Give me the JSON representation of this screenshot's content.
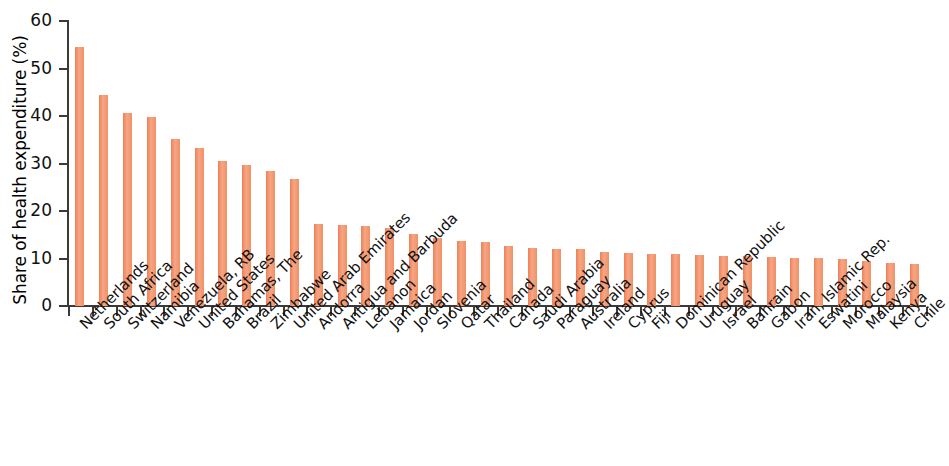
{
  "chart_data": {
    "type": "bar",
    "title": "",
    "subtitle": "",
    "xlabel": "",
    "ylabel": "Share of health expenditure (%)",
    "ylim": [
      0,
      60
    ],
    "yticks": [
      0,
      10,
      20,
      30,
      40,
      50,
      60
    ],
    "ytick_labels": [
      "0",
      "10",
      "20",
      "30",
      "40",
      "50",
      "60"
    ],
    "grid": false,
    "legend": null,
    "bar_color": "#f0885e",
    "axis_color": "#3a3a3a",
    "categories": [
      "Netherlands",
      "South Africa",
      "Switzerland",
      "Namibia",
      "Venezuela, RB",
      "United States",
      "Bahamas, The",
      "Brazil",
      "Zimbabwe",
      "United Arab Emirates",
      "Andorra",
      "Antigua and Barbuda",
      "Lebanon",
      "Jamaica",
      "Jordan",
      "Slovenia",
      "Qatar",
      "Thailand",
      "Canada",
      "Saudi Arabia",
      "Paraguay",
      "Australia",
      "Ireland",
      "Cyprus",
      "Fiji",
      "Dominican Republic",
      "Uruguay",
      "Israel",
      "Bahrain",
      "Gabon",
      "Iran, Islamic Rep.",
      "Eswatini",
      "Morocco",
      "Malaysia",
      "Kenya",
      "Chile"
    ],
    "values": [
      54.5,
      44.4,
      40.6,
      39.8,
      35.2,
      33.2,
      30.6,
      29.6,
      28.4,
      26.8,
      17.2,
      17.0,
      16.9,
      16.4,
      15.1,
      14.3,
      13.6,
      13.5,
      12.7,
      12.3,
      12.1,
      11.9,
      11.3,
      11.1,
      11.0,
      10.9,
      10.8,
      10.5,
      10.5,
      10.3,
      10.2,
      10.1,
      9.8,
      9.4,
      9.1,
      8.8
    ]
  }
}
